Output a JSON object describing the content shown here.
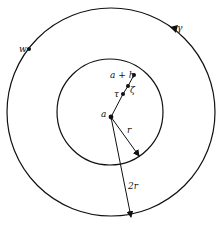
{
  "diagram": {
    "stroke_color": "#111111",
    "background": "#ffffff",
    "outer_circle": {
      "cx": 111,
      "cy": 112,
      "r": 104,
      "label": "γ",
      "label_pos": [
        177,
        31
      ]
    },
    "inner_circle": {
      "cx": 110,
      "cy": 112,
      "r": 53
    },
    "points": [
      {
        "id": "a",
        "label": "a",
        "x": 111,
        "y": 117,
        "label_x": 101,
        "label_y": 117
      },
      {
        "id": "tau",
        "label": "τ",
        "x": 123,
        "y": 94,
        "label_x": 114,
        "label_y": 97
      },
      {
        "id": "zeta",
        "label": "ζ",
        "x": 128,
        "y": 86,
        "label_x": 130,
        "label_y": 93
      },
      {
        "id": "a_plus_h",
        "label": "a + h",
        "x": 134,
        "y": 75,
        "label_x": 110,
        "label_y": 78
      },
      {
        "id": "w",
        "label": "w",
        "x": 29,
        "y": 49,
        "label_x": 19,
        "label_y": 52
      }
    ],
    "radius_arrows": [
      {
        "id": "r",
        "label": "r",
        "from": [
          111,
          117
        ],
        "to": [
          139,
          156
        ],
        "label_x": 127,
        "label_y": 133
      },
      {
        "id": "2r",
        "label": "2r",
        "from": [
          111,
          117
        ],
        "to": [
          131,
          217
        ],
        "label_x": 128,
        "label_y": 189
      }
    ],
    "orientation_arrow": {
      "on": "outer_circle",
      "at": [
        174,
        29
      ],
      "direction": "counterclockwise"
    }
  }
}
